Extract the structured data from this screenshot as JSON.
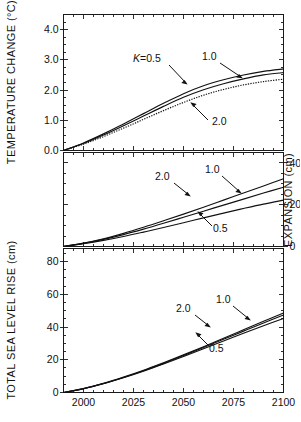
{
  "figure": {
    "background_color": "#ffffff",
    "line_color": "#111111",
    "panels": [
      "temperature-change",
      "thermal-expansion",
      "total-sea-level-rise"
    ]
  },
  "chart_data": [
    {
      "type": "line",
      "panel": "top",
      "title": "",
      "xlabel": "",
      "ylabel": "TEMPERATURE CHANGE (°C)",
      "xlim": [
        1990,
        2100
      ],
      "ylim": [
        0.0,
        4.5
      ],
      "yticks": [
        0.0,
        1.0,
        2.0,
        3.0,
        4.0
      ],
      "ytick_labels": [
        "0.0",
        "1.0",
        "2.0",
        "3.0",
        "4.0"
      ],
      "yminor_step": 0.25,
      "xticks": [
        2000,
        2025,
        2050,
        2075,
        2100
      ],
      "xtick_labels": [
        "",
        "",
        "",
        "",
        ""
      ],
      "xminor_step": 5,
      "grid": false,
      "legend": "inline-annotations",
      "x": [
        1990,
        2000,
        2010,
        2020,
        2030,
        2040,
        2050,
        2060,
        2070,
        2080,
        2090,
        2100
      ],
      "series": [
        {
          "name": "K = 0.5",
          "label": "K=0.5",
          "style": "solid",
          "values": [
            0.0,
            0.25,
            0.55,
            0.88,
            1.22,
            1.56,
            1.88,
            2.14,
            2.34,
            2.5,
            2.62,
            2.7
          ]
        },
        {
          "name": "K = 1.0",
          "label": "1.0",
          "style": "solid",
          "values": [
            0.0,
            0.23,
            0.51,
            0.82,
            1.14,
            1.46,
            1.76,
            2.01,
            2.21,
            2.37,
            2.5,
            2.58
          ]
        },
        {
          "name": "K = 2.0",
          "label": "2.0",
          "style": "dotted",
          "values": [
            0.0,
            0.21,
            0.46,
            0.74,
            1.03,
            1.32,
            1.59,
            1.83,
            2.02,
            2.17,
            2.28,
            2.36
          ]
        }
      ]
    },
    {
      "type": "line",
      "panel": "middle",
      "title": "",
      "xlabel": "",
      "ylabel": "EXPANSION (cm)",
      "ylabel_side": "right",
      "xlim": [
        1990,
        2100
      ],
      "ylim": [
        0,
        45
      ],
      "yticks": [
        0,
        20,
        40
      ],
      "ytick_labels": [
        "0",
        "20",
        "40"
      ],
      "yminor_step": 5,
      "xticks": [
        2000,
        2025,
        2050,
        2075,
        2100
      ],
      "xtick_labels": [
        "",
        "",
        "",
        "",
        ""
      ],
      "xminor_step": 5,
      "grid": false,
      "legend": "inline-annotations",
      "x": [
        1990,
        2000,
        2010,
        2020,
        2030,
        2040,
        2050,
        2060,
        2070,
        2080,
        2090,
        2100
      ],
      "series": [
        {
          "name": "K = 2.0",
          "label": "2.0",
          "style": "solid",
          "values": [
            0.0,
            1.6,
            3.7,
            6.3,
            9.2,
            12.3,
            15.5,
            18.8,
            22.2,
            25.6,
            29.0,
            32.4
          ]
        },
        {
          "name": "K = 1.0",
          "label": "1.0",
          "style": "solid",
          "values": [
            0.0,
            1.5,
            3.4,
            5.7,
            8.3,
            11.1,
            14.0,
            16.9,
            19.8,
            22.7,
            25.6,
            28.4
          ]
        },
        {
          "name": "K = 0.5",
          "label": "0.5",
          "style": "solid",
          "values": [
            0.0,
            1.3,
            2.9,
            4.8,
            6.9,
            9.1,
            11.4,
            13.7,
            16.0,
            18.2,
            20.3,
            22.2
          ]
        }
      ]
    },
    {
      "type": "line",
      "panel": "bottom",
      "title": "",
      "xlabel": "",
      "ylabel": "TOTAL SEA LEVEL RISE (cm)",
      "xlim": [
        1990,
        2100
      ],
      "ylim": [
        0,
        88
      ],
      "yticks": [
        0,
        20,
        40,
        60,
        80
      ],
      "ytick_labels": [
        "0",
        "20",
        "40",
        "60",
        "80"
      ],
      "yminor_step": 5,
      "xticks": [
        2000,
        2025,
        2050,
        2075,
        2100
      ],
      "xtick_labels": [
        "2000",
        "2025",
        "2050",
        "2075",
        "2100"
      ],
      "xminor_step": 5,
      "grid": false,
      "legend": "inline-annotations",
      "x": [
        1990,
        2000,
        2010,
        2020,
        2030,
        2040,
        2050,
        2060,
        2070,
        2080,
        2090,
        2100
      ],
      "series": [
        {
          "name": "K = 2.0",
          "label": "2.0",
          "style": "solid",
          "values": [
            0.0,
            2.4,
            5.6,
            9.4,
            13.6,
            18.2,
            23.0,
            28.0,
            33.1,
            38.3,
            43.5,
            48.6
          ]
        },
        {
          "name": "K = 1.0",
          "label": "1.0",
          "style": "solid",
          "values": [
            0.0,
            2.4,
            5.5,
            9.2,
            13.3,
            17.8,
            22.6,
            27.5,
            32.5,
            37.5,
            42.5,
            47.4
          ]
        },
        {
          "name": "K = 0.5",
          "label": "0.5",
          "style": "solid",
          "values": [
            0.0,
            2.3,
            5.4,
            9.0,
            13.0,
            17.4,
            22.0,
            26.7,
            31.5,
            36.2,
            40.8,
            45.2
          ]
        }
      ]
    }
  ],
  "annotations": {
    "top": [
      {
        "name": "k-equals-0.5",
        "text_italic": "K",
        "text_rest": "=0.5"
      },
      {
        "name": "curve-1.0",
        "text": "1.0"
      },
      {
        "name": "curve-2.0",
        "text": "2.0"
      }
    ],
    "middle": [
      {
        "name": "curve-2.0",
        "text": "2.0"
      },
      {
        "name": "curve-1.0",
        "text": "1.0"
      },
      {
        "name": "curve-0.5",
        "text": "0.5"
      }
    ],
    "bottom": [
      {
        "name": "curve-2.0",
        "text": "2.0"
      },
      {
        "name": "curve-1.0",
        "text": "1.0"
      },
      {
        "name": "curve-0.5",
        "text": "0.5"
      }
    ]
  },
  "axis_titles": {
    "top_y": "TEMPERATURE CHANGE (°C)",
    "middle_y_right": "EXPANSION (cm)",
    "bottom_y": "TOTAL SEA LEVEL RISE (cm)"
  },
  "tick_labels": {
    "top_y": [
      "4.0",
      "3.0",
      "2.0",
      "1.0",
      "0.0"
    ],
    "middle_y_right": [
      "40",
      "20",
      "0"
    ],
    "bottom_y": [
      "80",
      "60",
      "40",
      "20",
      "0"
    ],
    "x": [
      "2000",
      "2025",
      "2050",
      "2075",
      "2100"
    ]
  }
}
